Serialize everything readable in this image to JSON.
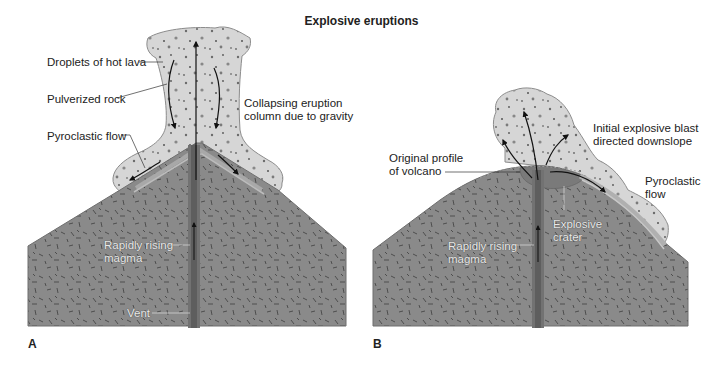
{
  "title": "Explosive eruptions",
  "colors": {
    "mountain": "#8a8a8a",
    "mountain_edge": "#6e6e6e",
    "cloud": "#d9d9d9",
    "cloud_edge": "#8c8c8c",
    "conduit": "#707070",
    "text": "#222222"
  },
  "panel_a": {
    "letter": "A",
    "labels": {
      "droplets": "Droplets of hot lava",
      "pulverized": "Pulverized rock",
      "pyroclastic": "Pyroclastic flow",
      "collapsing_line1": "Collapsing eruption",
      "collapsing_line2": "column due to gravity",
      "magma_line1": "Rapidly rising",
      "magma_line2": "magma",
      "vent": "Vent"
    }
  },
  "panel_b": {
    "letter": "B",
    "labels": {
      "original_line1": "Original profile",
      "original_line2": "of volcano",
      "initial_line1": "Initial explosive blast",
      "initial_line2": "directed downslope",
      "pyroclastic_line1": "Pyroclastic",
      "pyroclastic_line2": "flow",
      "crater_line1": "Explosive",
      "crater_line2": "crater",
      "magma_line1": "Rapidly rising",
      "magma_line2": "magma"
    }
  }
}
